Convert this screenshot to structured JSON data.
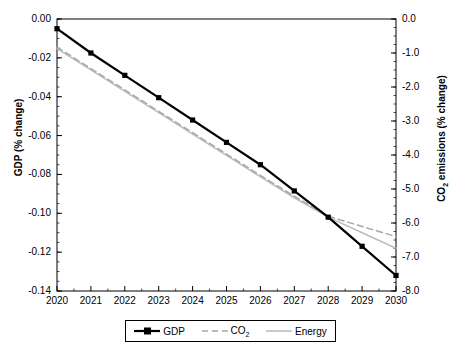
{
  "chart_data": {
    "type": "line",
    "title": "",
    "xlabel": "",
    "ylabel": "GDP (% change)",
    "ylabel_right": "CO2 emissions (% change)",
    "grid": false,
    "legend_position": "bottom",
    "x": [
      2020,
      2021,
      2022,
      2023,
      2024,
      2025,
      2026,
      2027,
      2028,
      2029,
      2030
    ],
    "categories": [
      "2020",
      "2021",
      "2022",
      "2023",
      "2024",
      "2025",
      "2026",
      "2027",
      "2028",
      "2029",
      "2030"
    ],
    "ylim": [
      -0.14,
      0.0
    ],
    "ylim_right": [
      -8.0,
      0.0
    ],
    "yticks": [
      "0.00",
      "-0.02",
      "-0.04",
      "-0.06",
      "-0.08",
      "-0.10",
      "-0.12",
      "-0.14"
    ],
    "ytick_values": [
      0.0,
      -0.02,
      -0.04,
      -0.06,
      -0.08,
      -0.1,
      -0.12,
      -0.14
    ],
    "yticks_right": [
      "0.0",
      "-1.0",
      "-2.0",
      "-3.0",
      "-4.0",
      "-5.0",
      "-6.0",
      "-7.0",
      "-8.0"
    ],
    "ytick_values_right": [
      0.0,
      -1.0,
      -2.0,
      -3.0,
      -4.0,
      -5.0,
      -6.0,
      -7.0,
      -8.0
    ],
    "series": [
      {
        "name": "GDP",
        "axis": "left",
        "color": "#000000",
        "style": "solid",
        "markers": true,
        "values": [
          -0.005,
          -0.0175,
          -0.029,
          -0.0405,
          -0.052,
          -0.0635,
          -0.075,
          -0.0885,
          -0.102,
          -0.117,
          -0.132
        ]
      },
      {
        "name": "CO2",
        "axis": "left",
        "color": "#a8a8a8",
        "style": "dashed",
        "markers": false,
        "values": [
          -0.0145,
          -0.0255,
          -0.0365,
          -0.0475,
          -0.0585,
          -0.0695,
          -0.0805,
          -0.0912,
          -0.1015,
          -0.1068,
          -0.112
        ]
      },
      {
        "name": "Energy",
        "axis": "left",
        "color": "#bdbdbd",
        "style": "solid",
        "markers": false,
        "values": [
          -0.0152,
          -0.0262,
          -0.0372,
          -0.0482,
          -0.0592,
          -0.0702,
          -0.0812,
          -0.092,
          -0.102,
          -0.11,
          -0.118
        ]
      }
    ],
    "series_right_equivalent": [
      {
        "name": "CO2",
        "values": [
          -0.83,
          -1.46,
          -2.09,
          -2.71,
          -3.34,
          -3.97,
          -4.6,
          -5.21,
          -5.8,
          -6.1,
          -6.4
        ]
      }
    ]
  },
  "legend": {
    "items": [
      {
        "label": "GDP",
        "sub": ""
      },
      {
        "label": "CO",
        "sub": "2"
      },
      {
        "label": "Energy",
        "sub": ""
      }
    ]
  },
  "axes": {
    "left_title_main": "GDP (% change)",
    "right_title_pre": "CO",
    "right_title_sub": "2",
    "right_title_post": " emissions (% change)"
  }
}
